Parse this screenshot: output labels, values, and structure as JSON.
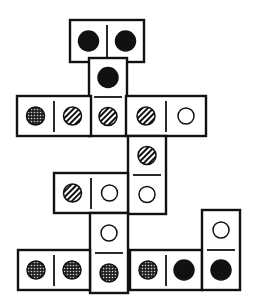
{
  "diagram": {
    "type": "domino-tile-puzzle",
    "stroke_color": "#111111",
    "background": "#ffffff",
    "pip_legend": {
      "black": "solid filled circle",
      "striped": "diagonal hatched circle",
      "dotted": "stippled / dotted circle",
      "empty": "open circle"
    },
    "tiles": [
      {
        "id": "t1",
        "orientation": "horizontal",
        "x": 70,
        "y": 20,
        "w": 74,
        "h": 42,
        "pips": [
          "black",
          "black"
        ]
      },
      {
        "id": "t2",
        "orientation": "vertical",
        "x": 89,
        "y": 58,
        "w": 38,
        "h": 78,
        "pips": [
          "black",
          "striped"
        ]
      },
      {
        "id": "t3",
        "orientation": "horizontal",
        "x": 17,
        "y": 96,
        "w": 74,
        "h": 40,
        "pips": [
          "dotted",
          "striped"
        ]
      },
      {
        "id": "t4",
        "orientation": "horizontal",
        "x": 126,
        "y": 96,
        "w": 80,
        "h": 40,
        "pips": [
          "striped",
          "empty"
        ]
      },
      {
        "id": "t5",
        "orientation": "vertical",
        "x": 128,
        "y": 136,
        "w": 38,
        "h": 78,
        "pips": [
          "striped",
          "empty"
        ]
      },
      {
        "id": "t6",
        "orientation": "horizontal",
        "x": 54,
        "y": 173,
        "w": 74,
        "h": 40,
        "pips": [
          "striped",
          "empty"
        ]
      },
      {
        "id": "t7",
        "orientation": "vertical",
        "x": 90,
        "y": 213,
        "w": 38,
        "h": 80,
        "pips": [
          "empty",
          "dotted"
        ]
      },
      {
        "id": "t8",
        "orientation": "horizontal",
        "x": 18,
        "y": 250,
        "w": 72,
        "h": 40,
        "pips": [
          "dotted",
          "dotted"
        ]
      },
      {
        "id": "t9",
        "orientation": "horizontal",
        "x": 130,
        "y": 250,
        "w": 72,
        "h": 40,
        "pips": [
          "dotted",
          "black"
        ]
      },
      {
        "id": "t10",
        "orientation": "vertical",
        "x": 202,
        "y": 210,
        "w": 38,
        "h": 80,
        "pips": [
          "empty",
          "black"
        ]
      }
    ]
  }
}
